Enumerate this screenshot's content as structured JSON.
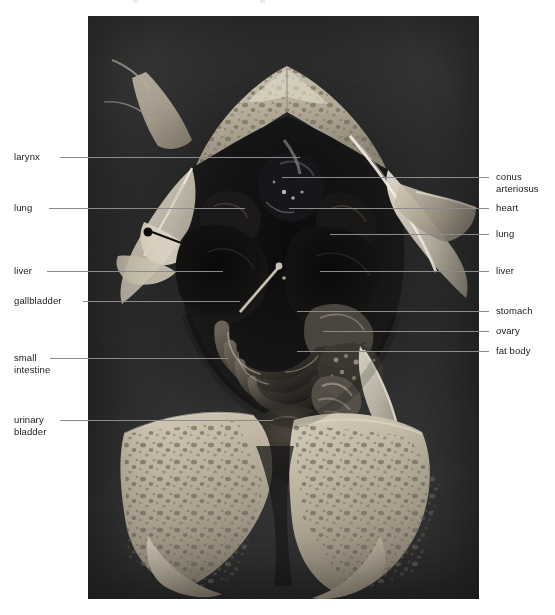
{
  "figure": {
    "kind": "anatomical-photograph",
    "plate": {
      "left": 88,
      "top": 16,
      "width": 391,
      "height": 583,
      "background_color": "#333232"
    }
  },
  "labels": {
    "left": [
      {
        "id": "larynx",
        "text": "larynx",
        "text_x": 14,
        "text_y": 151,
        "leader_x": 60,
        "leader_y": 157,
        "leader_width": 240
      },
      {
        "id": "lung-left",
        "text": "lung",
        "text_x": 14,
        "text_y": 202,
        "leader_x": 49,
        "leader_y": 208,
        "leader_width": 196
      },
      {
        "id": "liver-left",
        "text": "liver",
        "text_x": 14,
        "text_y": 265,
        "leader_x": 47,
        "leader_y": 271,
        "leader_width": 176
      },
      {
        "id": "gallbladder",
        "text": "gallbladder",
        "text_x": 14,
        "text_y": 295,
        "leader_x": 83,
        "leader_y": 301,
        "leader_width": 157
      },
      {
        "id": "small-intestine",
        "text": "small\nintestine",
        "text_x": 14,
        "text_y": 352,
        "leader_x": 50,
        "leader_y": 358,
        "leader_width": 178
      },
      {
        "id": "urinary-bladder",
        "text": "urinary\nbladder",
        "text_x": 14,
        "text_y": 414,
        "leader_x": 60,
        "leader_y": 420,
        "leader_width": 213
      }
    ],
    "right": [
      {
        "id": "conus-arteriosus",
        "text": "conus\narteriosus",
        "text_x": 496,
        "text_y": 171,
        "leader_x": 282,
        "leader_y": 177,
        "leader_width": 207
      },
      {
        "id": "heart",
        "text": "heart",
        "text_x": 496,
        "text_y": 202,
        "leader_x": 289,
        "leader_y": 208,
        "leader_width": 200
      },
      {
        "id": "lung-right",
        "text": "lung",
        "text_x": 496,
        "text_y": 228,
        "leader_x": 330,
        "leader_y": 234,
        "leader_width": 159
      },
      {
        "id": "liver-right",
        "text": "liver",
        "text_x": 496,
        "text_y": 265,
        "leader_x": 320,
        "leader_y": 271,
        "leader_width": 169
      },
      {
        "id": "stomach",
        "text": "stomach",
        "text_x": 496,
        "text_y": 305,
        "leader_x": 297,
        "leader_y": 311,
        "leader_width": 192
      },
      {
        "id": "ovary",
        "text": "ovary",
        "text_x": 496,
        "text_y": 325,
        "leader_x": 323,
        "leader_y": 331,
        "leader_width": 166
      },
      {
        "id": "fat-body",
        "text": "fat body",
        "text_x": 496,
        "text_y": 345,
        "leader_x": 297,
        "leader_y": 351,
        "leader_width": 192
      }
    ]
  },
  "colors": {
    "leader_line": "#8b8b8b",
    "label_text": "#1a1a1a",
    "page_background": "#ffffff",
    "plate_dark": "#2e2d2d",
    "specimen_skin_light": "#cfc6b6",
    "specimen_skin_mottle": "#6f6a60",
    "organ_dark": "#121212",
    "organ_mid": "#47433d",
    "membrane_white": "#e8e3d6"
  }
}
